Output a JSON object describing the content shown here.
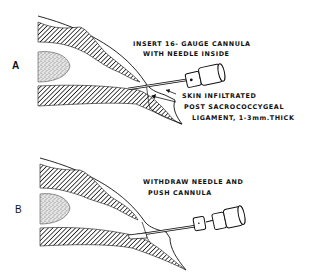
{
  "figure": {
    "panels": [
      {
        "letter": "A",
        "instruction": [
          "INSERT 16- GAUGE CANNULA",
          "WITH NEEDLE INSIDE"
        ],
        "annotations": [
          "SKIN INFILTRATED",
          "POST SACROCOCCYGEAL",
          "LIGAMENT, 1-3mm.THICK"
        ]
      },
      {
        "letter": "B",
        "instruction": [
          "WITHDRAW NEEDLE AND",
          "PUSH CANNULA"
        ]
      }
    ],
    "colors": {
      "ink": "#111111",
      "background": "#ffffff",
      "stipple": "#9a9a9a"
    }
  }
}
